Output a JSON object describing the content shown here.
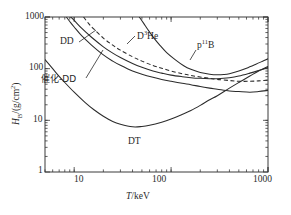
{
  "figure": {
    "background_color": "#ffffff",
    "line_color": "#2b2b2b"
  },
  "chart_data": {
    "type": "line",
    "title": "",
    "subtitle": "",
    "xlabel": "T/keV",
    "ylabel": "HB/(g/cm2)",
    "xscale": "log",
    "yscale": "log",
    "xlim": [
      5,
      1000
    ],
    "ylim": [
      1,
      1000
    ],
    "grid": false,
    "legend_position": "inline-annotations",
    "x_tick_labels": [
      "10",
      "100",
      "1000"
    ],
    "x_tick_values": [
      10,
      100,
      1000
    ],
    "y_tick_labels": [
      "1",
      "10",
      "100",
      "1000"
    ],
    "y_tick_values": [
      1,
      10,
      100,
      1000
    ],
    "annotations": [
      {
        "text": "DD",
        "x_keV": 13,
        "y_value": 330
      },
      {
        "text": "D3He",
        "x_keV": 30,
        "y_value": 260
      },
      {
        "text": "p11B",
        "x_keV": 210,
        "y_value": 260
      },
      {
        "text": "催化-DD",
        "x_keV": 22,
        "y_value": 58
      },
      {
        "text": "DT",
        "x_keV": 115,
        "y_value": 5.6
      }
    ],
    "series": [
      {
        "name": "DT",
        "style": "solid",
        "x": [
          5,
          6,
          7,
          8,
          10,
          13,
          16,
          20,
          25,
          30,
          40,
          50,
          60,
          80,
          100,
          130,
          160,
          200,
          250,
          300,
          400,
          500,
          650,
          800,
          1000
        ],
        "values": [
          150,
          100,
          71,
          54,
          35,
          22,
          16,
          12,
          9.5,
          8.4,
          7.5,
          7.6,
          8.0,
          9.2,
          10.6,
          13.0,
          15.5,
          19.5,
          25,
          30,
          42,
          54,
          72,
          90,
          110
        ]
      },
      {
        "name": "catalyzed-DD",
        "style": "solid",
        "x": [
          8.3,
          9,
          10,
          12,
          15,
          20,
          25,
          30,
          40,
          50,
          65,
          80,
          100,
          130,
          160,
          200,
          250,
          300,
          400,
          500,
          650,
          800,
          1000
        ],
        "values": [
          1000,
          820,
          640,
          430,
          290,
          185,
          140,
          116,
          90,
          78,
          68,
          62,
          57,
          52,
          49,
          45,
          42,
          40,
          37,
          36,
          35,
          36,
          38
        ]
      },
      {
        "name": "DD",
        "style": "solid",
        "x": [
          9.2,
          10,
          12,
          15,
          20,
          25,
          30,
          40,
          50,
          65,
          80,
          100,
          130,
          160,
          200,
          250,
          300,
          400,
          500,
          650,
          800,
          1000
        ],
        "values": [
          1000,
          860,
          600,
          410,
          265,
          200,
          165,
          126,
          106,
          90,
          82,
          75,
          70,
          67,
          65,
          64,
          64,
          67,
          72,
          82,
          92,
          105
        ]
      },
      {
        "name": "D3He",
        "style": "dashed",
        "x": [
          12.5,
          14,
          16,
          20,
          25,
          30,
          40,
          50,
          65,
          80,
          100,
          130,
          160,
          200,
          250,
          300,
          400,
          500,
          650,
          800,
          1000
        ],
        "values": [
          1000,
          760,
          580,
          390,
          285,
          228,
          170,
          140,
          115,
          102,
          90,
          80,
          74,
          69,
          65,
          62,
          59,
          57,
          57,
          58,
          60
        ]
      },
      {
        "name": "p11B",
        "style": "solid",
        "x": [
          47,
          52,
          58,
          66,
          76,
          90,
          110,
          135,
          160,
          200,
          250,
          300,
          350,
          400,
          500,
          600,
          750,
          900,
          1000
        ],
        "values": [
          1000,
          760,
          560,
          400,
          290,
          205,
          150,
          114,
          97,
          84,
          78,
          76,
          77,
          80,
          90,
          102,
          122,
          142,
          155
        ]
      }
    ]
  }
}
